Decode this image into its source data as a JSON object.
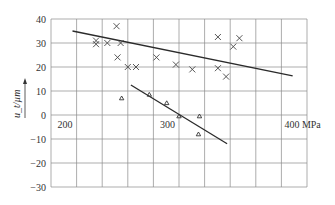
{
  "chart_data": {
    "type": "scatter",
    "title": "",
    "xlabel": "MPa",
    "ylabel": "u_t/µm",
    "xlim": [
      175,
      425
    ],
    "ylim": [
      -30,
      40
    ],
    "grid": true,
    "x_gridlines": [
      175,
      200,
      225,
      250,
      275,
      300,
      325,
      350,
      375,
      400,
      425
    ],
    "y_ticks": [
      40,
      30,
      20,
      10,
      0,
      -10,
      -20,
      -30
    ],
    "x_tick_labels": [
      {
        "value": 200,
        "text": "200"
      },
      {
        "value": 300,
        "text": "300"
      },
      {
        "value": 400,
        "text": "400 MPa"
      }
    ],
    "series": [
      {
        "name": "cross",
        "marker": "x",
        "points": [
          [
            219,
            31
          ],
          [
            219,
            29.5
          ],
          [
            230,
            30
          ],
          [
            239,
            37
          ],
          [
            243,
            30
          ],
          [
            240,
            24
          ],
          [
            250,
            20
          ],
          [
            258,
            20
          ],
          [
            278,
            24
          ],
          [
            297,
            21
          ],
          [
            313,
            19
          ],
          [
            338,
            32.5
          ],
          [
            338,
            19.5
          ],
          [
            346,
            16
          ],
          [
            353,
            28.5
          ],
          [
            359,
            32
          ]
        ],
        "trendline": [
          [
            196,
            35
          ],
          [
            411,
            16.3
          ]
        ]
      },
      {
        "name": "triangle",
        "marker": "triangle",
        "points": [
          [
            244,
            7
          ],
          [
            271,
            8.5
          ],
          [
            288,
            5
          ],
          [
            300,
            -0.5
          ],
          [
            320,
            -0.5
          ],
          [
            319,
            -8
          ]
        ],
        "trendline": [
          [
            253,
            12.5
          ],
          [
            347,
            -12
          ]
        ]
      }
    ]
  }
}
